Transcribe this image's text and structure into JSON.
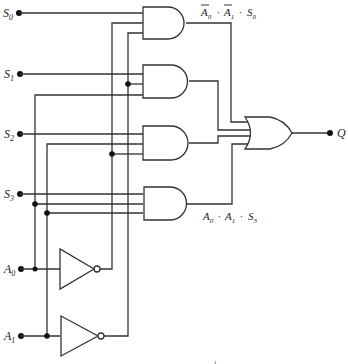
{
  "diagram": {
    "type": "logic-circuit",
    "inputs": [
      {
        "label": "S",
        "sub": "0"
      },
      {
        "label": "S",
        "sub": "1"
      },
      {
        "label": "S",
        "sub": "2"
      },
      {
        "label": "S",
        "sub": "3"
      },
      {
        "label": "A",
        "sub": "0"
      },
      {
        "label": "A",
        "sub": "1"
      }
    ],
    "output": {
      "label": "Q"
    },
    "gates": {
      "and": 4,
      "or": 1,
      "not": 2
    },
    "annotations": {
      "top": {
        "terms": [
          {
            "label": "A",
            "sub": "0",
            "bar": true
          },
          {
            "label": "A",
            "sub": "1",
            "bar": true
          },
          {
            "label": "S",
            "sub": "0",
            "bar": false
          }
        ],
        "separator": "·"
      },
      "bottom": {
        "terms": [
          {
            "label": "A",
            "sub": "0",
            "bar": false
          },
          {
            "label": "A",
            "sub": "1",
            "bar": false
          },
          {
            "label": "S",
            "sub": "3",
            "bar": false
          }
        ],
        "separator": "·"
      }
    },
    "footer_mark": "1"
  }
}
